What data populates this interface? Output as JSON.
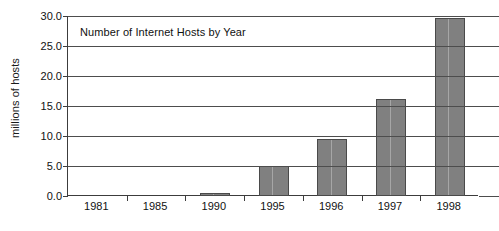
{
  "chart_data": {
    "type": "bar",
    "title": "Number of Internet Hosts by Year",
    "xlabel": "",
    "ylabel": "millions of hosts",
    "categories": [
      "1981",
      "1985",
      "1990",
      "1995",
      "1996",
      "1997",
      "1998"
    ],
    "values": [
      0.0,
      0.0,
      0.3,
      5.0,
      9.5,
      16.1,
      29.7
    ],
    "series": [
      {
        "name": "Internet hosts",
        "values": [
          0.0,
          0.0,
          0.3,
          5.0,
          9.5,
          16.1,
          29.7
        ]
      }
    ],
    "ylim": [
      0.0,
      30.0
    ],
    "ytick_labels": [
      "30.0",
      "25.0",
      "20.0",
      "15.0",
      "10.0",
      "5.0",
      "0.0"
    ],
    "ytick_values": [
      30.0,
      25.0,
      20.0,
      15.0,
      10.0,
      5.0,
      0.0
    ],
    "ytick_step": 5.0,
    "grid": true,
    "grid_axis": "y",
    "legend": false,
    "legend_position": "none",
    "bar_color": "#808080",
    "bar_edge_color": "#4a4a4a",
    "axis_color": "#3c3c3c",
    "grid_color": "#4d4d4d",
    "background_color": "#ffffff",
    "text_color": "#111111",
    "title_position": "inside-top-left"
  }
}
